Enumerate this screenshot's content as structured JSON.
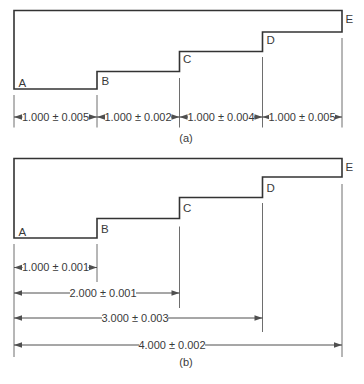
{
  "figure": {
    "colors": {
      "background": "#ffffff",
      "outline": "#333333",
      "thinline": "#6e6e6e",
      "dimline": "#4f4f4f",
      "text": "#3a3a3a"
    },
    "diagram_a": {
      "caption": "(a)",
      "points": [
        "A",
        "B",
        "C",
        "D",
        "E"
      ],
      "dims": [
        {
          "value": "1.000 ± 0.005"
        },
        {
          "value": "1.000 ± 0.002"
        },
        {
          "value": "1.000 ± 0.004"
        },
        {
          "value": "1.000 ± 0.005"
        }
      ]
    },
    "diagram_b": {
      "caption": "(b)",
      "points": [
        "A",
        "B",
        "C",
        "D",
        "E"
      ],
      "dims": [
        {
          "value": "1.000 ± 0.001"
        },
        {
          "value": "2.000 ± 0.001"
        },
        {
          "value": "3.000 ± 0.003"
        },
        {
          "value": "4.000 ± 0.002"
        }
      ]
    }
  }
}
